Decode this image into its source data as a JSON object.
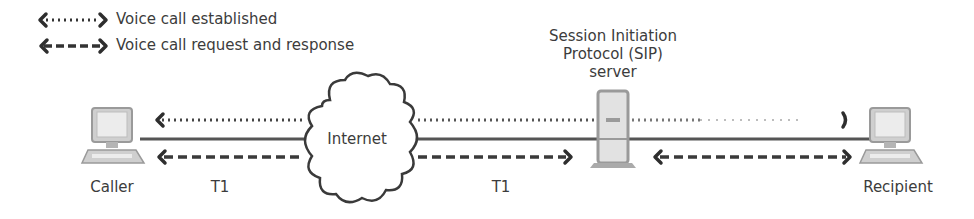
{
  "legend": {
    "items": [
      {
        "style": "dotted",
        "label": "Voice call established"
      },
      {
        "style": "dashed",
        "label": "Voice call request and response"
      }
    ]
  },
  "nodes": {
    "caller": {
      "label": "Caller",
      "icon": "desktop-computer-icon"
    },
    "internet": {
      "label": "Internet",
      "icon": "cloud-icon"
    },
    "sip_server": {
      "label_lines": [
        "Session Initiation",
        "Protocol (SIP)",
        "server"
      ],
      "icon": "server-tower-icon"
    },
    "recipient": {
      "label": "Recipient",
      "icon": "desktop-computer-icon"
    }
  },
  "links": [
    {
      "from": "caller",
      "to": "internet",
      "label": "T1"
    },
    {
      "from": "internet",
      "to": "sip_server",
      "label": "T1"
    },
    {
      "from": "sip_server",
      "to": "recipient",
      "label": ""
    }
  ],
  "flows": [
    {
      "type": "dotted",
      "meaning": "Voice call established",
      "from": "recipient",
      "to": "caller"
    },
    {
      "type": "dashed",
      "meaning": "Voice call request and response",
      "segments": [
        {
          "from": "internet",
          "to": "caller"
        },
        {
          "from": "internet",
          "to": "sip_server"
        },
        {
          "from": "sip_server",
          "to": "recipient"
        },
        {
          "from": "recipient",
          "to": "sip_server"
        }
      ]
    }
  ],
  "colors": {
    "line": "#555555",
    "arrow": "#2e2e2e",
    "device_fill": "#d6d6d6",
    "device_stroke": "#9a9a9a",
    "text": "#3c3c3c"
  }
}
